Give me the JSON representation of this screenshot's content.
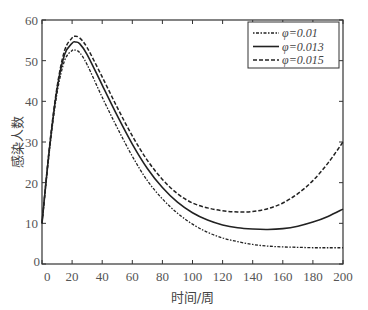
{
  "chart_data": {
    "type": "line",
    "title": "",
    "xlabel": "时间/周",
    "ylabel": "感染人数",
    "xlim": [
      0,
      200
    ],
    "ylim": [
      0,
      60
    ],
    "xticks": [
      0,
      20,
      40,
      60,
      80,
      100,
      120,
      140,
      160,
      180,
      200
    ],
    "yticks": [
      0,
      10,
      20,
      30,
      40,
      50,
      60
    ],
    "grid": false,
    "legend_position": "upper right",
    "x": [
      0,
      5,
      10,
      15,
      20,
      22,
      25,
      30,
      40,
      50,
      60,
      70,
      80,
      90,
      100,
      110,
      120,
      130,
      140,
      150,
      160,
      170,
      180,
      190,
      200
    ],
    "series": [
      {
        "name": "φ=0.01",
        "style": "dash-dot",
        "values": [
          10,
          28,
          42,
          50,
          52.5,
          52.6,
          52,
          49,
          41,
          33.5,
          26.5,
          20.5,
          16,
          12.5,
          9.8,
          7.8,
          6.4,
          5.5,
          4.8,
          4.4,
          4.2,
          4.1,
          4.0,
          4.0,
          4.0
        ]
      },
      {
        "name": "φ=0.013",
        "style": "solid",
        "values": [
          10,
          28.5,
          43,
          51.5,
          54.3,
          54.6,
          54.2,
          51.5,
          44,
          36.5,
          29.5,
          23.5,
          18.8,
          15.2,
          12.6,
          10.8,
          9.6,
          8.9,
          8.6,
          8.5,
          8.7,
          9.3,
          10.3,
          11.7,
          13.5
        ]
      },
      {
        "name": "φ=0.015",
        "style": "dashed",
        "values": [
          10,
          29,
          43.5,
          52.5,
          55.6,
          56,
          55.6,
          53.2,
          46,
          38.5,
          31.5,
          25.5,
          20.8,
          17.3,
          15,
          13.8,
          13.1,
          12.8,
          12.9,
          13.6,
          15,
          17.3,
          20.5,
          24.8,
          30
        ]
      }
    ],
    "legend": [
      "φ=0.01",
      "φ=0.013",
      "φ=0.015"
    ]
  }
}
